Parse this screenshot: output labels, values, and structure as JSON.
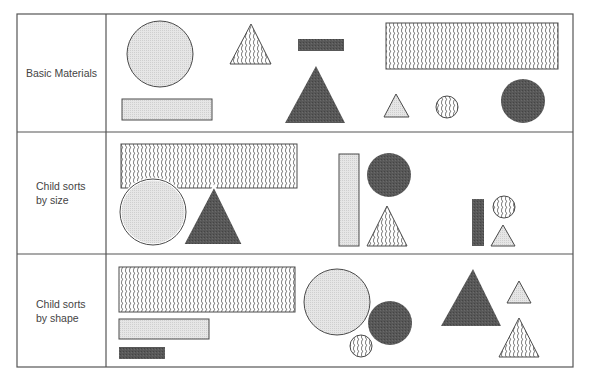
{
  "rows": [
    {
      "label": "Basic Materials",
      "label_lines": [
        "Basic Materials"
      ]
    },
    {
      "label": "Child sorts by size",
      "label_lines": [
        "Child sorts",
        "by size"
      ]
    },
    {
      "label": "Child sorts by shape",
      "label_lines": [
        "Child sorts",
        "by shape"
      ]
    }
  ],
  "fills": {
    "light_gray": "#e2e2e2",
    "dark_gray": "#555555",
    "wavy_hatch": "#6a6a6a",
    "outline": "#4a4a4a"
  },
  "shapes_per_row": {
    "basic_materials": [
      {
        "shape": "circle",
        "size": "large",
        "fill": "light"
      },
      {
        "shape": "triangle",
        "size": "small-medium",
        "fill": "wavy"
      },
      {
        "shape": "rectangle",
        "size": "small",
        "fill": "dark"
      },
      {
        "shape": "rectangle",
        "size": "large",
        "fill": "wavy"
      },
      {
        "shape": "rectangle",
        "size": "medium",
        "fill": "light"
      },
      {
        "shape": "triangle",
        "size": "large",
        "fill": "dark"
      },
      {
        "shape": "triangle",
        "size": "small",
        "fill": "light"
      },
      {
        "shape": "circle",
        "size": "small",
        "fill": "wavy"
      },
      {
        "shape": "circle",
        "size": "medium",
        "fill": "dark"
      }
    ]
  }
}
